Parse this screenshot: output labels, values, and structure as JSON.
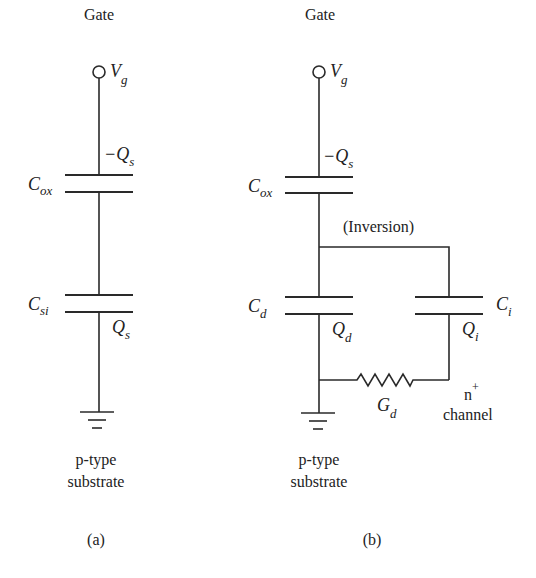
{
  "diagram": {
    "type": "circuit-schematic",
    "colors": {
      "line": "#2a2a2a",
      "text": "#222222",
      "background": "#ffffff"
    },
    "panel_a": {
      "caption": "(a)",
      "gate_label": "Gate",
      "terminal": {
        "symbol": "V",
        "subscript": "g"
      },
      "top_charge": {
        "symbol": "−Q",
        "subscript": "s"
      },
      "oxide_cap": {
        "symbol": "C",
        "subscript": "ox"
      },
      "silicon_cap": {
        "symbol": "C",
        "subscript": "si"
      },
      "bottom_charge": {
        "symbol": "Q",
        "subscript": "s"
      },
      "substrate_line1": "p-type",
      "substrate_line2": "substrate"
    },
    "panel_b": {
      "caption": "(b)",
      "gate_label": "Gate",
      "terminal": {
        "symbol": "V",
        "subscript": "g"
      },
      "top_charge": {
        "symbol": "−Q",
        "subscript": "s"
      },
      "oxide_cap": {
        "symbol": "C",
        "subscript": "ox"
      },
      "branch_label": "(Inversion)",
      "depletion_cap": {
        "symbol": "C",
        "subscript": "d"
      },
      "depletion_charge": {
        "symbol": "Q",
        "subscript": "d"
      },
      "inversion_cap": {
        "symbol": "C",
        "subscript": "i"
      },
      "inversion_charge": {
        "symbol": "Q",
        "subscript": "i"
      },
      "conductance": {
        "symbol": "G",
        "subscript": "d"
      },
      "channel_line1": "n",
      "channel_sup": "+",
      "channel_line2": "channel",
      "substrate_line1": "p-type",
      "substrate_line2": "substrate"
    }
  }
}
